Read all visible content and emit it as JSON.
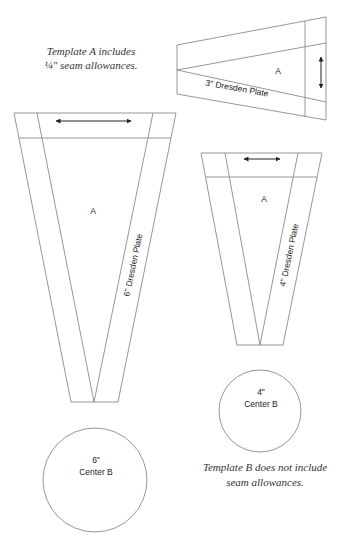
{
  "notes": {
    "template_a_line1": "Template A includes",
    "template_a_line2": "¼\" seam allowances.",
    "template_b_line1": "Template B does not include",
    "template_b_line2": "seam allowances."
  },
  "templates": {
    "three_inch": {
      "piece_label": "A",
      "name": "3\" Dresden Plate"
    },
    "six_inch": {
      "piece_label": "A",
      "name": "6\" Dresden Plate"
    },
    "four_inch": {
      "piece_label": "A",
      "name": "4\" Dresden Plate"
    }
  },
  "centers": {
    "four_inch": {
      "size": "4\"",
      "name": "Center B"
    },
    "six_inch": {
      "size": "6\"",
      "name": "Center B"
    }
  },
  "colors": {
    "line": "#8a8a8a",
    "text": "#222222"
  }
}
